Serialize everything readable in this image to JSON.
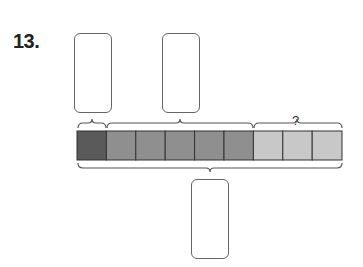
{
  "problem": {
    "number": "13.",
    "unknown_label": "?"
  },
  "tape_diagram": {
    "total_cells": 9,
    "segments": [
      {
        "name": "first-part",
        "cells": 1,
        "color": "#5a5a5a",
        "answer_box": "blank"
      },
      {
        "name": "second-part",
        "cells": 5,
        "color": "#8f8f8f",
        "answer_box": "blank"
      },
      {
        "name": "unknown-part",
        "cells": 3,
        "color": "#c8c8c8",
        "label": "?"
      }
    ],
    "whole_answer_box": "blank"
  }
}
